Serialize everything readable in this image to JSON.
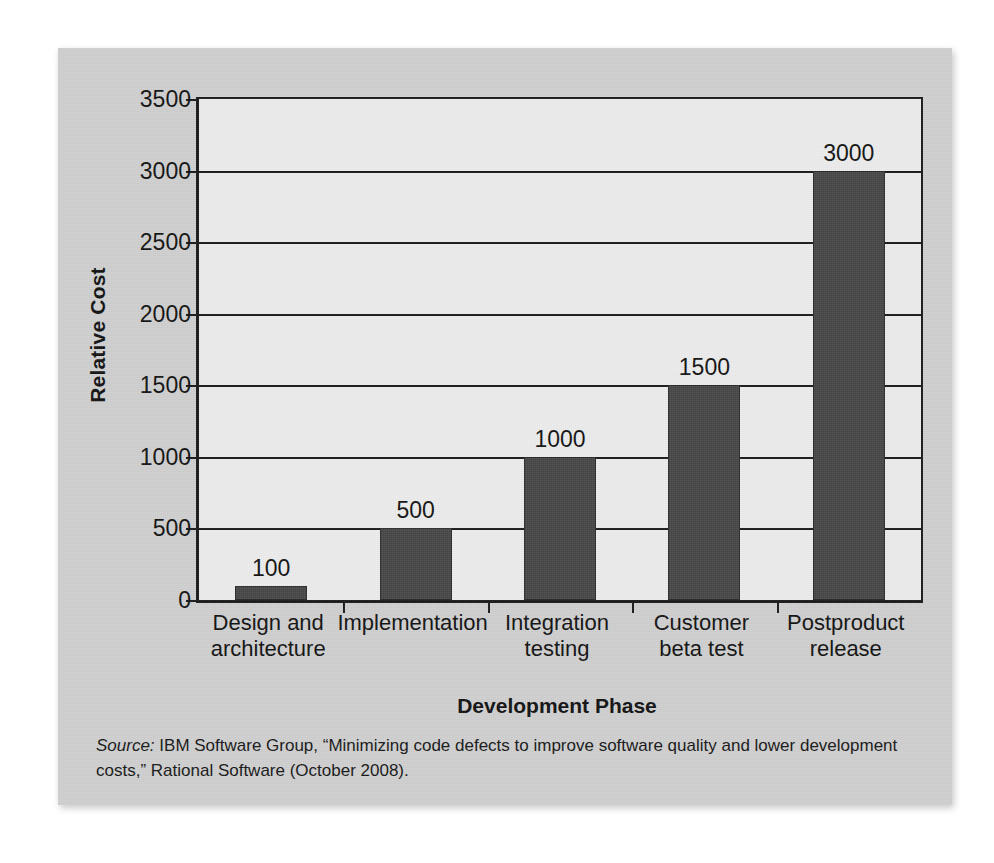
{
  "figure": {
    "source_note_lead": "Source:",
    "source_note_text": " IBM Software Group, “Minimizing code defects to improve software quality and lower development costs,” Rational Software (October 2008)."
  },
  "colors": {
    "panel_background": "#cfcfcf",
    "plot_background": "#ececec",
    "bar_fill": "#474747",
    "axis": "#1a1a1a",
    "text": "#121212"
  },
  "chart_data": {
    "type": "bar",
    "title": "",
    "xlabel": "Development Phase",
    "ylabel": "Relative Cost",
    "categories": [
      "Design and architecture",
      "Implementation",
      "Integration testing",
      "Customer beta test",
      "Postproduct release"
    ],
    "category_lines": [
      [
        "Design and",
        "architecture"
      ],
      [
        "Implementation"
      ],
      [
        "Integration",
        "testing"
      ],
      [
        "Customer",
        "beta test"
      ],
      [
        "Postproduct",
        "release"
      ]
    ],
    "values": [
      100,
      500,
      1000,
      1500,
      3000
    ],
    "value_labels": [
      "100",
      "500",
      "1000",
      "1500",
      "3000"
    ],
    "ylim": [
      0,
      3500
    ],
    "yticks": [
      0,
      500,
      1000,
      1500,
      2000,
      2500,
      3000,
      3500
    ],
    "ytick_labels": [
      "0",
      "500",
      "1000",
      "1500",
      "2000",
      "2500",
      "3000",
      "3500"
    ],
    "grid": true,
    "legend": "none"
  }
}
